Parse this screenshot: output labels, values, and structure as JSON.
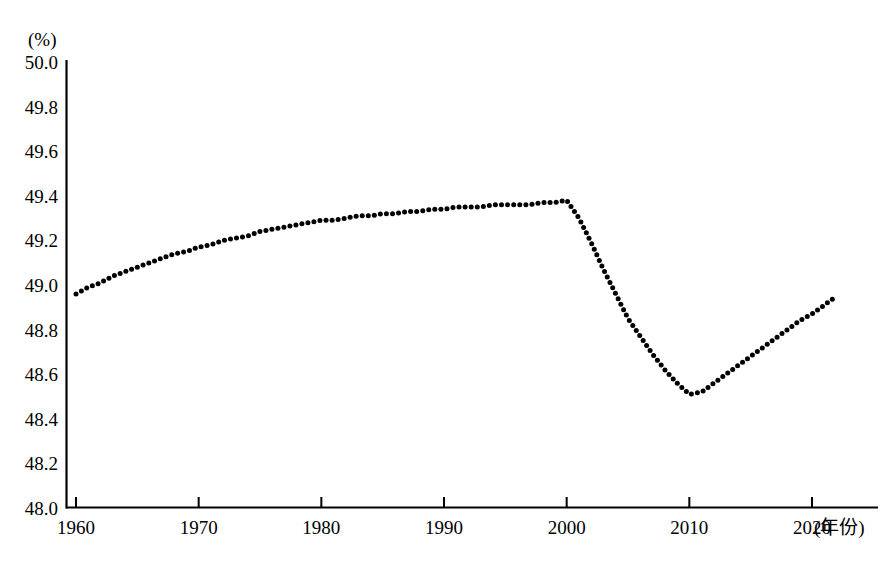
{
  "chart_data": {
    "type": "line",
    "title": "",
    "subtitle": "",
    "xlabel": "(年份)",
    "ylabel": "(%)",
    "yunit": "(%)",
    "xlim": [
      1960,
      2022
    ],
    "ylim": [
      48.0,
      50.0
    ],
    "grid": false,
    "legend": null,
    "legend_position": "none",
    "line_style": "dotted",
    "line_color": "#000000",
    "axis_color": "#000000",
    "background_color": "#ffffff",
    "ytick_labels": [
      "50.0",
      "49.8",
      "49.6",
      "49.4",
      "49.2",
      "49.0",
      "48.8",
      "48.6",
      "48.4",
      "48.2",
      "48.0"
    ],
    "ytick_values": [
      50.0,
      49.8,
      49.6,
      49.4,
      49.2,
      49.0,
      48.8,
      48.6,
      48.4,
      48.2,
      48.0
    ],
    "xtick_labels": [
      "1960",
      "1970",
      "1980",
      "1990",
      "2000",
      "2010",
      "2020"
    ],
    "xtick_values": [
      1960,
      1970,
      1980,
      1990,
      2000,
      2010,
      2020
    ],
    "x": [
      1960,
      1961,
      1962,
      1963,
      1964,
      1965,
      1966,
      1967,
      1968,
      1969,
      1970,
      1971,
      1972,
      1973,
      1974,
      1975,
      1976,
      1977,
      1978,
      1979,
      1980,
      1981,
      1982,
      1983,
      1984,
      1985,
      1986,
      1987,
      1988,
      1989,
      1990,
      1991,
      1992,
      1993,
      1994,
      1995,
      1996,
      1997,
      1998,
      1999,
      2000,
      2001,
      2002,
      2003,
      2004,
      2005,
      2006,
      2007,
      2008,
      2009,
      2010,
      2011,
      2012,
      2013,
      2014,
      2015,
      2016,
      2017,
      2018,
      2019,
      2020,
      2021,
      2022
    ],
    "values": [
      48.96,
      48.99,
      49.01,
      49.04,
      49.06,
      49.08,
      49.1,
      49.12,
      49.14,
      49.15,
      49.17,
      49.18,
      49.2,
      49.21,
      49.22,
      49.24,
      49.25,
      49.26,
      49.27,
      49.28,
      49.29,
      49.29,
      49.3,
      49.31,
      49.31,
      49.32,
      49.32,
      49.33,
      49.33,
      49.34,
      49.34,
      49.35,
      49.35,
      49.35,
      49.36,
      49.36,
      49.36,
      49.36,
      49.37,
      49.37,
      49.38,
      49.3,
      49.19,
      49.07,
      48.96,
      48.85,
      48.77,
      48.69,
      48.62,
      48.56,
      48.51,
      48.52,
      48.56,
      48.6,
      48.64,
      48.68,
      48.72,
      48.76,
      48.8,
      48.84,
      48.87,
      48.91,
      48.95
    ]
  }
}
